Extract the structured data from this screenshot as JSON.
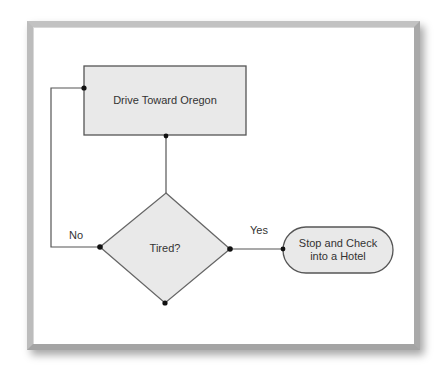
{
  "diagram": {
    "type": "flowchart",
    "nodes": [
      {
        "id": "process",
        "shape": "rectangle",
        "label": "Drive Toward Oregon"
      },
      {
        "id": "decision",
        "shape": "diamond",
        "label": "Tired?"
      },
      {
        "id": "terminal",
        "shape": "rounded-terminal",
        "label_line1": "Stop and Check",
        "label_line2": "into a Hotel"
      }
    ],
    "edges": [
      {
        "from": "process",
        "to": "decision",
        "label": ""
      },
      {
        "from": "decision",
        "to": "terminal",
        "label": "Yes"
      },
      {
        "from": "decision",
        "to": "process",
        "label": "No"
      }
    ],
    "colors": {
      "node_fill": "#e9e9e9",
      "node_stroke": "#555555",
      "line": "#555555",
      "connector_dot": "#111111",
      "text": "#333333",
      "frame_border": "#b4b4b4"
    }
  }
}
